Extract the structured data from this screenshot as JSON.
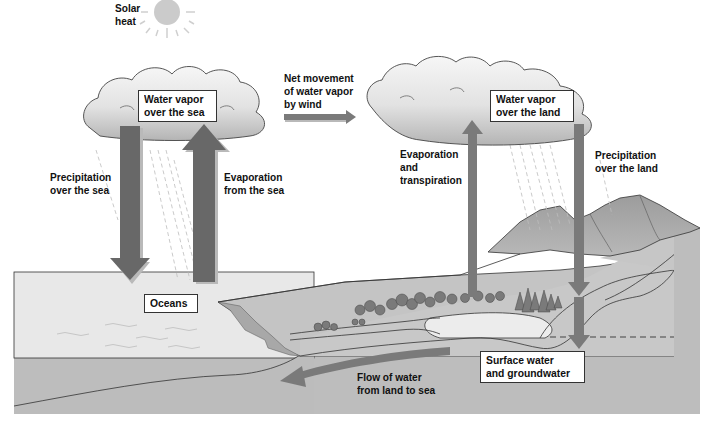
{
  "colors": {
    "arrow": "#6b6b6b",
    "arrow_shadow": "#b9b9b9",
    "cloud_top": "#f4f4f4",
    "cloud_bottom": "#b8b8b8",
    "ocean": "#e6e6e6",
    "ground": "#bdbdbd",
    "land_surface": "#c8c8c8",
    "mountain": "#a9a9a9",
    "sun": "#c8c8c8",
    "outline": "#333333"
  },
  "labels": {
    "solar_heat": "Solar\nheat",
    "net_movement": "Net movement\nof water vapor\nby wind",
    "precip_sea": "Precipitation\nover the sea",
    "evap_sea": "Evaporation\nfrom the sea",
    "evap_transp": "Evaporation\nand\ntranspiration",
    "precip_land": "Precipitation\nover the land",
    "flow_land_sea": "Flow of water\nfrom land to sea"
  },
  "boxes": {
    "vapor_sea": "Water vapor\nover the sea",
    "vapor_land": "Water vapor\nover the land",
    "oceans": "Oceans",
    "surface_ground": "Surface water\nand groundwater"
  },
  "icons": {
    "sun": "sun-icon",
    "cloud_sea": "cloud-icon",
    "cloud_land": "cloud-icon",
    "trees": "tree-icon"
  }
}
